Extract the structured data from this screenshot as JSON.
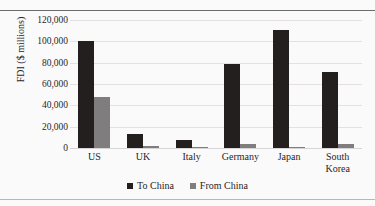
{
  "page": {
    "running_head": "",
    "background_color": "#fbfafa"
  },
  "chart_data": {
    "type": "bar",
    "title": "",
    "subtitle": "",
    "xlabel": "",
    "ylabel": "FDI ($ millions)",
    "categories": [
      "US",
      "UK",
      "Italy",
      "Germany",
      "Japan",
      "South\nKorea"
    ],
    "category_labels_flat": [
      "US",
      "UK",
      "Italy",
      "Germany",
      "Japan",
      "South Korea"
    ],
    "series": [
      {
        "name": "To China",
        "color": "#231f1f",
        "values": [
          100000,
          13000,
          8000,
          79000,
          111000,
          71000
        ]
      },
      {
        "name": "From China",
        "color": "#7f7d7d",
        "values": [
          48000,
          1500,
          1200,
          4000,
          800,
          4000
        ]
      }
    ],
    "ylim": [
      0,
      120000
    ],
    "ytick_values": [
      120000,
      100000,
      80000,
      60000,
      40000,
      20000,
      0
    ],
    "ytick_labels": [
      "120,000",
      "100,000",
      "80,000",
      "60,000",
      "40,000",
      "20,000",
      "0"
    ],
    "grid": "horizontal",
    "legend_position": "bottom-center",
    "grouped": true,
    "bar_order": "to-china-then-from-china"
  }
}
